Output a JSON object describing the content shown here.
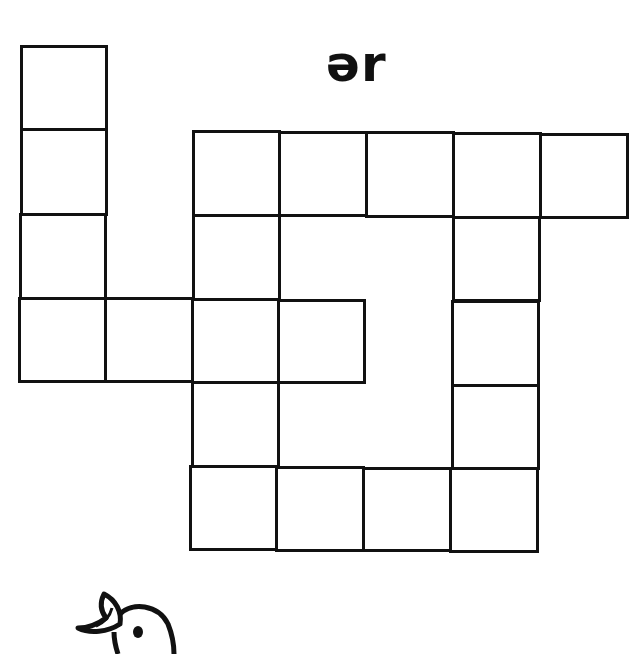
{
  "worksheet": {
    "phoneme_label": "ər",
    "puzzle_type": "crossword-style letter grid",
    "cells": [
      {
        "id": "c1",
        "x": 20,
        "y": 45,
        "w": 88,
        "h": 86
      },
      {
        "id": "c2",
        "x": 20,
        "y": 128,
        "w": 88,
        "h": 88
      },
      {
        "id": "c3",
        "x": 19,
        "y": 213,
        "w": 88,
        "h": 87
      },
      {
        "id": "c4",
        "x": 18,
        "y": 297,
        "w": 89,
        "h": 86
      },
      {
        "id": "c5",
        "x": 104,
        "y": 297,
        "w": 90,
        "h": 86
      },
      {
        "id": "c6",
        "x": 191,
        "y": 298,
        "w": 89,
        "h": 86
      },
      {
        "id": "c7",
        "x": 277,
        "y": 299,
        "w": 89,
        "h": 85
      },
      {
        "id": "c8",
        "x": 192,
        "y": 130,
        "w": 89,
        "h": 87
      },
      {
        "id": "c9",
        "x": 278,
        "y": 131,
        "w": 90,
        "h": 86
      },
      {
        "id": "c10",
        "x": 365,
        "y": 131,
        "w": 90,
        "h": 87
      },
      {
        "id": "c11",
        "x": 452,
        "y": 132,
        "w": 90,
        "h": 87
      },
      {
        "id": "c12",
        "x": 539,
        "y": 133,
        "w": 90,
        "h": 86
      },
      {
        "id": "c13",
        "x": 192,
        "y": 214,
        "w": 89,
        "h": 87
      },
      {
        "id": "c14",
        "x": 191,
        "y": 381,
        "w": 89,
        "h": 87
      },
      {
        "id": "c15",
        "x": 452,
        "y": 216,
        "w": 89,
        "h": 86
      },
      {
        "id": "c16",
        "x": 451,
        "y": 300,
        "w": 89,
        "h": 87
      },
      {
        "id": "c17",
        "x": 451,
        "y": 384,
        "w": 89,
        "h": 86
      },
      {
        "id": "c18",
        "x": 189,
        "y": 465,
        "w": 89,
        "h": 86
      },
      {
        "id": "c19",
        "x": 275,
        "y": 466,
        "w": 90,
        "h": 86
      },
      {
        "id": "c20",
        "x": 362,
        "y": 467,
        "w": 90,
        "h": 85
      },
      {
        "id": "c21",
        "x": 449,
        "y": 467,
        "w": 90,
        "h": 86
      }
    ],
    "illustration": "bird-head"
  }
}
